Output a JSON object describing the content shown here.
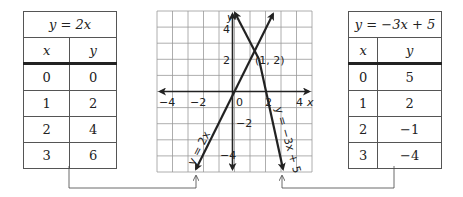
{
  "left_table": {
    "title": "y = 2x",
    "headers": [
      "x",
      "y"
    ],
    "rows": [
      [
        "0",
        "0"
      ],
      [
        "1",
        "2"
      ],
      [
        "2",
        "4"
      ],
      [
        "3",
        "6"
      ]
    ]
  },
  "right_table": {
    "title": "y = −3x + 5",
    "headers": [
      "x",
      "y"
    ],
    "rows": [
      [
        "0",
        "5"
      ],
      [
        "1",
        "2"
      ],
      [
        "2",
        "−1"
      ],
      [
        "3",
        "−4"
      ]
    ]
  },
  "graph": {
    "x_axis_label": "x",
    "y_axis_label": "y",
    "x_ticks": [
      "−4",
      "−2",
      "0",
      "2",
      "4"
    ],
    "y_ticks": [
      "4",
      "2",
      "−2",
      "−4"
    ],
    "intersection_label": "(1, 2)",
    "line1_label": "y = 2x",
    "line2_label": "y = −3x + 5"
  }
}
